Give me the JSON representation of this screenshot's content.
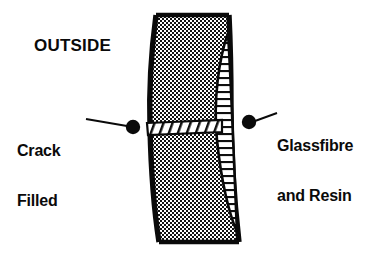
{
  "figure": {
    "title_label": "OUTSIDE",
    "background_color": "#ffffff",
    "ink_color": "#0a0a0a",
    "callouts": [
      {
        "name": "crack-filled",
        "line1": "Crack",
        "line2": "Filled",
        "side": "left",
        "dot": {
          "x": 133,
          "y": 127,
          "r": 7
        },
        "leader": {
          "x1": 127,
          "y1": 126,
          "x2": 86,
          "y2": 119
        }
      },
      {
        "name": "glassfibre-and-resin",
        "line1": "Glassfibre",
        "line2": "and Resin",
        "side": "right",
        "dot": {
          "x": 249,
          "y": 122,
          "r": 7
        },
        "leader": {
          "x1": 255,
          "y1": 121,
          "x2": 276,
          "y2": 114
        }
      }
    ],
    "regions": [
      {
        "name": "laminate-body",
        "fill": "checkerboard-stipple",
        "description": "Curved slab section seen edge-on, outlined in heavy black"
      },
      {
        "name": "glassfibre-resin-strip",
        "fill": "ladder-hatch",
        "description": "Narrow lens shaped repair strip on the inner face, tapering to a point at the top and widening toward the bottom"
      },
      {
        "name": "filled-crack-band",
        "fill": "diagonal-hatch",
        "description": "White horizontal band with diagonal hatching crossing the slab at mid height"
      }
    ]
  }
}
